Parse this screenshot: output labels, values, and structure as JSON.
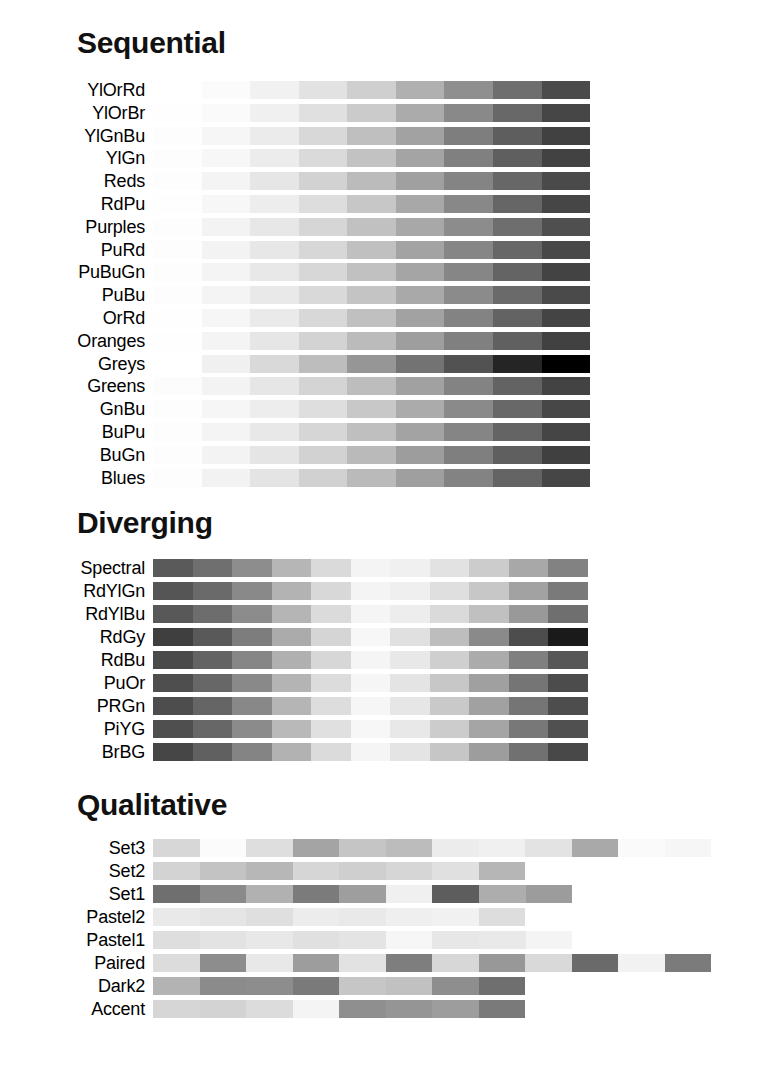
{
  "page": {
    "background": "#ffffff",
    "width": 780,
    "height": 1084
  },
  "sections": [
    {
      "id": "sequential",
      "title": "Sequential",
      "row_pitch": 22.8,
      "strip_width": 437,
      "n_classes": 9,
      "rows": [
        {
          "label": "YlOrRd",
          "colors": [
            "#ffffff",
            "#fbfbfb",
            "#f1f1f1",
            "#e2e2e2",
            "#cfcfcf",
            "#b0b0b0",
            "#8f8f8f",
            "#6e6e6e",
            "#4b4b4b"
          ]
        },
        {
          "label": "YlOrBr",
          "colors": [
            "#fefefe",
            "#fafafa",
            "#f0f0f0",
            "#e0e0e0",
            "#cbcbcb",
            "#ababab",
            "#898989",
            "#686868",
            "#464646"
          ]
        },
        {
          "label": "YlGnBu",
          "colors": [
            "#fdfdfd",
            "#f6f6f6",
            "#ebebeb",
            "#d8d8d8",
            "#bfbfbf",
            "#a2a2a2",
            "#7e7e7e",
            "#5e5e5e",
            "#414141"
          ]
        },
        {
          "label": "YlGn",
          "colors": [
            "#fdfdfd",
            "#f7f7f7",
            "#ececec",
            "#dadada",
            "#c2c2c2",
            "#a4a4a4",
            "#808080",
            "#5f5f5f",
            "#424242"
          ]
        },
        {
          "label": "Reds",
          "colors": [
            "#fdfdfd",
            "#f4f4f4",
            "#e6e6e6",
            "#d2d2d2",
            "#bbbbbb",
            "#a0a0a0",
            "#848484",
            "#676767",
            "#4a4a4a"
          ]
        },
        {
          "label": "RdPu",
          "colors": [
            "#fefefe",
            "#f7f7f7",
            "#ededed",
            "#dddddd",
            "#c7c7c7",
            "#a8a8a8",
            "#888888",
            "#666666",
            "#464646"
          ]
        },
        {
          "label": "Purples",
          "colors": [
            "#fdfdfd",
            "#f3f3f3",
            "#e7e7e7",
            "#d6d6d6",
            "#c1c1c1",
            "#a8a8a8",
            "#8c8c8c",
            "#6e6e6e",
            "#4f4f4f"
          ]
        },
        {
          "label": "PuRd",
          "colors": [
            "#fdfdfd",
            "#f3f3f3",
            "#e7e7e7",
            "#d7d7d7",
            "#c0c0c0",
            "#a3a3a3",
            "#868686",
            "#676767",
            "#484848"
          ]
        },
        {
          "label": "PuBuGn",
          "colors": [
            "#fdfdfd",
            "#f4f4f4",
            "#e8e8e8",
            "#d7d7d7",
            "#c1c1c1",
            "#a5a5a5",
            "#868686",
            "#646464",
            "#434343"
          ]
        },
        {
          "label": "PuBu",
          "colors": [
            "#fdfdfd",
            "#f4f4f4",
            "#e9e9e9",
            "#d9d9d9",
            "#c4c4c4",
            "#a9a9a9",
            "#8b8b8b",
            "#6a6a6a",
            "#4a4a4a"
          ]
        },
        {
          "label": "OrRd",
          "colors": [
            "#fefefe",
            "#f6f6f6",
            "#eaeaea",
            "#d8d8d8",
            "#c0c0c0",
            "#a2a2a2",
            "#838383",
            "#636363",
            "#444444"
          ]
        },
        {
          "label": "Oranges",
          "colors": [
            "#fefefe",
            "#f4f4f4",
            "#e6e6e6",
            "#d3d3d3",
            "#bbbbbb",
            "#9e9e9e",
            "#808080",
            "#606060",
            "#414141"
          ]
        },
        {
          "label": "Greys",
          "colors": [
            "#ffffff",
            "#f0f0f0",
            "#d9d9d9",
            "#bdbdbd",
            "#969696",
            "#737373",
            "#525252",
            "#252525",
            "#000000"
          ]
        },
        {
          "label": "Greens",
          "colors": [
            "#fcfcfc",
            "#f3f3f3",
            "#e6e6e6",
            "#d4d4d4",
            "#bdbdbd",
            "#a1a1a1",
            "#838383",
            "#636363",
            "#434343"
          ]
        },
        {
          "label": "GnBu",
          "colors": [
            "#fdfdfd",
            "#f6f6f6",
            "#ededed",
            "#dedede",
            "#c8c8c8",
            "#ababab",
            "#8a8a8a",
            "#686868",
            "#474747"
          ]
        },
        {
          "label": "BuPu",
          "colors": [
            "#fdfdfd",
            "#f4f4f4",
            "#e8e8e8",
            "#d6d6d6",
            "#bfbfbf",
            "#a3a3a3",
            "#858585",
            "#646464",
            "#454545"
          ]
        },
        {
          "label": "BuGn",
          "colors": [
            "#fdfdfd",
            "#f3f3f3",
            "#e5e5e5",
            "#d2d2d2",
            "#bababa",
            "#9d9d9d",
            "#7f7f7f",
            "#5f5f5f",
            "#404040"
          ]
        },
        {
          "label": "Blues",
          "colors": [
            "#fdfdfd",
            "#f2f2f2",
            "#e4e4e4",
            "#d1d1d1",
            "#bababa",
            "#9f9f9f",
            "#838383",
            "#646464",
            "#464646"
          ]
        }
      ]
    },
    {
      "id": "diverging",
      "title": "Diverging",
      "row_pitch": 23.0,
      "strip_width": 435,
      "n_classes": 11,
      "rows": [
        {
          "label": "Spectral",
          "colors": [
            "#5a5a5a",
            "#6f6f6f",
            "#8d8d8d",
            "#b6b6b6",
            "#dadada",
            "#f4f4f4",
            "#f0f0f0",
            "#e2e2e2",
            "#cccccc",
            "#a8a8a8",
            "#828282"
          ]
        },
        {
          "label": "RdYlGn",
          "colors": [
            "#555555",
            "#6a6a6a",
            "#898989",
            "#b3b3b3",
            "#d8d8d8",
            "#f4f4f4",
            "#efefef",
            "#dfdfdf",
            "#c7c7c7",
            "#a2a2a2",
            "#7a7a7a"
          ]
        },
        {
          "label": "RdYlBu",
          "colors": [
            "#585858",
            "#6d6d6d",
            "#8c8c8c",
            "#b5b5b5",
            "#dbdbdb",
            "#f5f5f5",
            "#ededed",
            "#dadada",
            "#c0c0c0",
            "#999999",
            "#6f6f6f"
          ]
        },
        {
          "label": "RdGy",
          "colors": [
            "#3f3f3f",
            "#595959",
            "#7d7d7d",
            "#ababab",
            "#d5d5d5",
            "#f7f7f7",
            "#e0e0e0",
            "#bdbdbd",
            "#8a8a8a",
            "#4d4d4d",
            "#1a1a1a"
          ]
        },
        {
          "label": "RdBu",
          "colors": [
            "#4a4a4a",
            "#636363",
            "#868686",
            "#b0b0b0",
            "#d7d7d7",
            "#f5f5f5",
            "#e8e8e8",
            "#cfcfcf",
            "#ababab",
            "#808080",
            "#575757"
          ]
        },
        {
          "label": "PuOr",
          "colors": [
            "#4e4e4e",
            "#676767",
            "#898989",
            "#b4b4b4",
            "#dcdcdc",
            "#f6f6f6",
            "#e4e4e4",
            "#c7c7c7",
            "#a0a0a0",
            "#757575",
            "#4c4c4c"
          ]
        },
        {
          "label": "PRGn",
          "colors": [
            "#4d4d4d",
            "#656565",
            "#888888",
            "#b5b5b5",
            "#dddddd",
            "#f6f6f6",
            "#e6e6e6",
            "#c9c9c9",
            "#a1a1a1",
            "#757575",
            "#4d4d4d"
          ]
        },
        {
          "label": "PiYG",
          "colors": [
            "#4f4f4f",
            "#676767",
            "#8b8b8b",
            "#b9b9b9",
            "#e0e0e0",
            "#f7f7f7",
            "#e8e8e8",
            "#cccccc",
            "#a5a5a5",
            "#787878",
            "#505050"
          ]
        },
        {
          "label": "BrBG",
          "colors": [
            "#464646",
            "#606060",
            "#848484",
            "#b2b2b2",
            "#dbdbdb",
            "#f5f5f5",
            "#e4e4e4",
            "#c6c6c6",
            "#9d9d9d",
            "#717171",
            "#484848"
          ]
        }
      ]
    },
    {
      "id": "qualitative",
      "title": "Qualitative",
      "row_pitch": 23.0,
      "swatch_width": 46.5,
      "rows": [
        {
          "label": "Set3",
          "n": 12,
          "width": 558,
          "colors": [
            "#d7d7d7",
            "#fbfbfb",
            "#dedede",
            "#a4a4a4",
            "#c5c5c5",
            "#bcbcbc",
            "#ececec",
            "#f0f0f0",
            "#e3e3e3",
            "#a9a9a9",
            "#fafafa",
            "#f6f6f6"
          ]
        },
        {
          "label": "Set2",
          "n": 8,
          "width": 372,
          "colors": [
            "#d3d3d3",
            "#c3c3c3",
            "#b7b7b7",
            "#d6d6d6",
            "#cfcfcf",
            "#d6d6d6",
            "#e0e0e0",
            "#b6b6b6"
          ]
        },
        {
          "label": "Set1",
          "n": 9,
          "width": 419,
          "colors": [
            "#6f6f6f",
            "#8a8a8a",
            "#b1b1b1",
            "#7b7b7b",
            "#9e9e9e",
            "#f0f0f0",
            "#5d5d5d",
            "#adadad",
            "#9c9c9c"
          ]
        },
        {
          "label": "Pastel2",
          "n": 8,
          "width": 372,
          "colors": [
            "#e9e9e9",
            "#e5e5e5",
            "#dfdfdf",
            "#ececec",
            "#e9e9e9",
            "#efefef",
            "#f1f1f1",
            "#dddddd"
          ]
        },
        {
          "label": "Pastel1",
          "n": 9,
          "width": 419,
          "colors": [
            "#dedede",
            "#e3e3e3",
            "#e8e8e8",
            "#e0e0e0",
            "#e4e4e4",
            "#f6f6f6",
            "#e7e7e7",
            "#e9e9e9",
            "#f4f4f4"
          ]
        },
        {
          "label": "Paired",
          "n": 12,
          "width": 558,
          "colors": [
            "#dcdcdc",
            "#8d8d8d",
            "#e8e8e8",
            "#9d9d9d",
            "#e2e2e2",
            "#7e7e7e",
            "#d7d7d7",
            "#989898",
            "#d9d9d9",
            "#6a6a6a",
            "#f2f2f2",
            "#7b7b7b"
          ]
        },
        {
          "label": "Dark2",
          "n": 8,
          "width": 372,
          "colors": [
            "#b3b3b3",
            "#8b8b8b",
            "#8d8d8d",
            "#7a7a7a",
            "#c6c6c6",
            "#c1c1c1",
            "#8e8e8e",
            "#6f6f6f"
          ]
        },
        {
          "label": "Accent",
          "n": 8,
          "width": 372,
          "colors": [
            "#d6d6d6",
            "#d3d3d3",
            "#dcdcdc",
            "#f4f4f4",
            "#8f8f8f",
            "#959595",
            "#9d9d9d",
            "#7a7a7a"
          ]
        }
      ]
    }
  ]
}
